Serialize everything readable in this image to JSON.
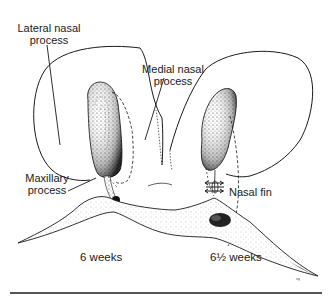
{
  "figure": {
    "labels": {
      "lateral_nasal_1": "Lateral nasal",
      "lateral_nasal_2": "process",
      "medial_nasal_1": "Medial nasal",
      "medial_nasal_2": "process",
      "maxillary_1": "Maxillary",
      "maxillary_2": "process",
      "nasal_fin": "Nasal fin"
    },
    "captions": {
      "left": "6 weeks",
      "right": "6½ weeks"
    },
    "colors": {
      "ink": "#1a1a1a",
      "rule": "#555555",
      "background": "#ffffff"
    }
  }
}
